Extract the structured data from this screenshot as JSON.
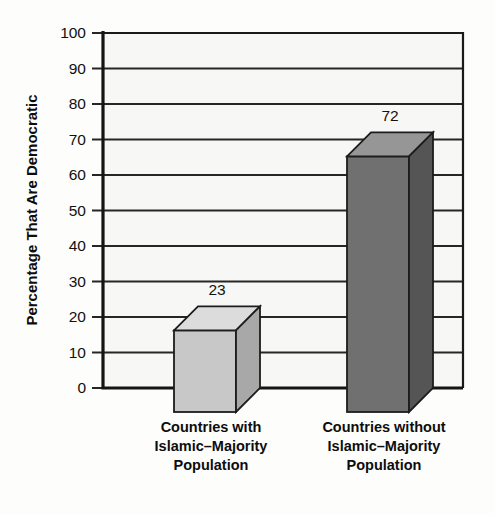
{
  "chart_data": {
    "type": "bar",
    "title": "",
    "subtitle": "",
    "xlabel": "",
    "ylabel": "Percentage That Are Democratic",
    "categories": [
      "Countries with Islamic–Majority Population",
      "Countries without Islamic–Majority Population"
    ],
    "category_lines": [
      [
        "Countries with",
        "Islamic–Majority",
        "Population"
      ],
      [
        "Countries without",
        "Islamic–Majority",
        "Population"
      ]
    ],
    "values": [
      23,
      72
    ],
    "value_labels": [
      "23",
      "72"
    ],
    "ylim": [
      0,
      100
    ],
    "ytick_step": 10,
    "ytick_labels": [
      "100",
      "90",
      "80",
      "70",
      "60",
      "50",
      "40",
      "30",
      "20",
      "10",
      "0"
    ],
    "ytick_values": [
      100,
      90,
      80,
      70,
      60,
      50,
      40,
      30,
      20,
      10,
      0
    ],
    "grid": true,
    "grid_orientation": "horizontal",
    "legend": false,
    "legend_position": "none",
    "style": "3d-column",
    "series": [
      {
        "name": "Percentage That Are Democratic",
        "values": [
          23,
          72
        ]
      }
    ]
  },
  "colors": {
    "plot_background": "#f7f7f5",
    "page_background": "#fdfdfc",
    "axis": "#141414",
    "grid": "#262626",
    "text": "#111111",
    "bar_1_front": "#c8c8c8",
    "bar_1_top": "#dcdcdc",
    "bar_1_side": "#a8a8a8",
    "bar_2_front": "#707070",
    "bar_2_top": "#969696",
    "bar_2_side": "#555555",
    "bar_outline": "#1c1c1c"
  }
}
